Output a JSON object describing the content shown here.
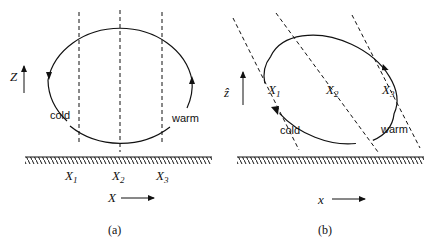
{
  "panels": [
    {
      "id": "a",
      "caption": "(a)",
      "vertical_axis": "Z",
      "horizontal_axis": "X",
      "columns": [
        "X1",
        "X2",
        "X3"
      ],
      "column_labels": {
        "x1": "X",
        "x1_sub": "1",
        "x2": "X",
        "x2_sub": "2",
        "x3": "X",
        "x3_sub": "3"
      },
      "left_label": "cold",
      "right_label": "warm"
    },
    {
      "id": "b",
      "caption": "(b)",
      "vertical_axis": "ẑ",
      "horizontal_axis": "x",
      "columns": [
        "X1",
        "X2",
        "X3"
      ],
      "column_labels": {
        "x1": "X",
        "x1_sub": "1",
        "x2": "X",
        "x2_sub": "2",
        "x3": "X",
        "x3_sub": "3"
      },
      "left_label": "cold",
      "right_label": "warm"
    }
  ],
  "colors": {
    "line": "#111111",
    "background": "#ffffff"
  }
}
